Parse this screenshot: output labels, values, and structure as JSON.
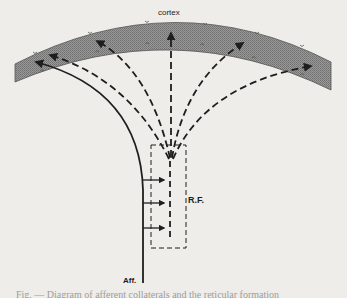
{
  "diagram": {
    "labels": {
      "cortex": "cortex",
      "reticular_formation": "R.F.",
      "afferent": "Aff."
    },
    "caption": "Fig. — Diagram of afferent collaterals and the reticular formation",
    "colors": {
      "background": "#eeede9",
      "cortex_fill": "#8f8f8f",
      "line": "#1e1e1e"
    },
    "nodes": [
      {
        "id": "cortex",
        "label": "cortex",
        "shape": "curved band (arc)"
      },
      {
        "id": "rf",
        "label": "R.F.",
        "shape": "dashed rectangle"
      },
      {
        "id": "aff",
        "label": "Aff.",
        "shape": "solid line (afferent pathway)"
      }
    ],
    "edges": [
      {
        "from": "aff",
        "to": "cortex",
        "style": "solid",
        "note": "specific afferent pathway curving to lateral cortex"
      },
      {
        "from": "aff",
        "to": "rf",
        "style": "solid arrows",
        "count": 3,
        "note": "collaterals into reticular formation"
      },
      {
        "from": "rf",
        "to": "cortex",
        "style": "dashed",
        "count": 5,
        "note": "diffuse ascending projections fanning to cortex"
      }
    ]
  }
}
